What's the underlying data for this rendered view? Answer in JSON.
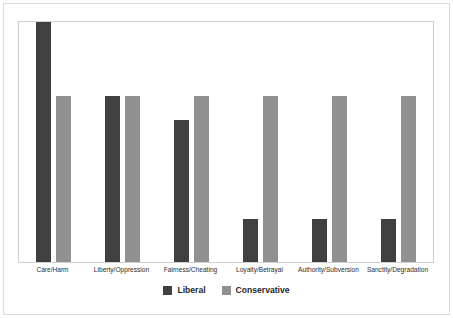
{
  "chart_data": {
    "type": "bar",
    "title": "",
    "subtitle": "",
    "xlabel": "",
    "ylabel": "",
    "ylim": [
      0,
      1
    ],
    "grid": false,
    "legend_position": "bottom",
    "categories": [
      "Care/Harm",
      "Liberty/Oppression",
      "Fairness/Cheating",
      "Loyalty/Betrayal",
      "Authority/Subversion",
      "Sanctity/Degradation"
    ],
    "series": [
      {
        "name": "Liberal",
        "color": "#404040",
        "values": [
          1.0,
          0.69,
          0.59,
          0.18,
          0.18,
          0.18
        ]
      },
      {
        "name": "Conservative",
        "color": "#919191",
        "values": [
          0.69,
          0.69,
          0.69,
          0.69,
          0.69,
          0.69
        ]
      }
    ],
    "axis_tick_labels": [],
    "annotations": []
  },
  "legend": {
    "items": [
      {
        "label": "Liberal",
        "swatch": "liberal"
      },
      {
        "label": "Conservative",
        "swatch": "conservative"
      }
    ]
  },
  "colors": {
    "series_liberal": "#404040",
    "series_conservative": "#919191",
    "plot_border": "#cfcfcf",
    "page_border": "#dcdcdc",
    "background": "#ffffff"
  }
}
